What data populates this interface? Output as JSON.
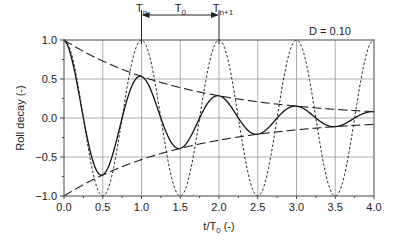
{
  "chart_data": {
    "type": "line",
    "title": "",
    "xlabel": "t/T0 (-)",
    "xlabel_main": "t/T",
    "xlabel_sub": "0",
    "xlabel_suffix": " (-)",
    "ylabel": "Roll decay (-)",
    "xlim": [
      0.0,
      4.0
    ],
    "ylim": [
      -1.0,
      1.0
    ],
    "grid": true,
    "x_ticks": [
      "0.0",
      "0.5",
      "1.0",
      "1.5",
      "2.0",
      "2.5",
      "3.0",
      "3.5",
      "4.0"
    ],
    "x_tick_values": [
      0,
      0.5,
      1,
      1.5,
      2,
      2.5,
      3,
      3.5,
      4
    ],
    "y_ticks": [
      "1.0",
      "0.5",
      "0.0",
      "−0.5",
      "−1.0"
    ],
    "y_tick_values": [
      1,
      0.5,
      0,
      -0.5,
      -1
    ],
    "damping": 0.1,
    "series": [
      {
        "name": "Damped roll decay",
        "style": "solid",
        "formula": "cos(2*pi*t)*exp(-2*pi*D*t)"
      },
      {
        "name": "Undamped oscillation",
        "style": "dotted",
        "formula": "cos(2*pi*t)"
      },
      {
        "name": "Upper envelope",
        "style": "dashed",
        "formula": "exp(-2*pi*D*t)"
      },
      {
        "name": "Lower envelope",
        "style": "dashed",
        "formula": "-exp(-2*pi*D*t)"
      }
    ],
    "annotations": {
      "damping_label": "D = 0.10",
      "tn_main": "T",
      "tn_sub": "n",
      "tn1_main": "T",
      "tn1_sub": "n+1",
      "t0_main": "T",
      "t0_sub": "0",
      "tn_x": 1.0,
      "tn1_x": 2.0
    }
  }
}
